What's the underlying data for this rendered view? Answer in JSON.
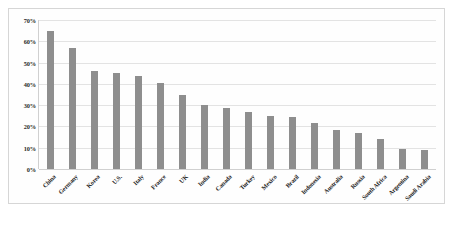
{
  "chart_data": {
    "type": "bar",
    "title": "",
    "xlabel": "",
    "ylabel": "",
    "ylim": [
      0,
      70
    ],
    "grid": true,
    "legend": false,
    "y_unit": "%",
    "y_ticks": [
      0,
      10,
      20,
      30,
      40,
      50,
      60,
      70
    ],
    "y_tick_labels": [
      "0%",
      "10%",
      "20%",
      "30%",
      "40%",
      "50%",
      "60%",
      "70%"
    ],
    "bar_color": "#8e8e8e",
    "categories": [
      "China",
      "Germany",
      "Korea",
      "U.S.",
      "Italy",
      "France",
      "UK",
      "India",
      "Canada",
      "Turkey",
      "Mexico",
      "Brazil",
      "Indonesia",
      "Australia",
      "Russia",
      "South Africa",
      "Argentina",
      "Saudi Arabia"
    ],
    "values": [
      65,
      57,
      46,
      45.2,
      43.5,
      40.5,
      35,
      30,
      28.7,
      26.7,
      24.7,
      24.3,
      21.5,
      18.3,
      17,
      14,
      9.5,
      8.8
    ]
  }
}
